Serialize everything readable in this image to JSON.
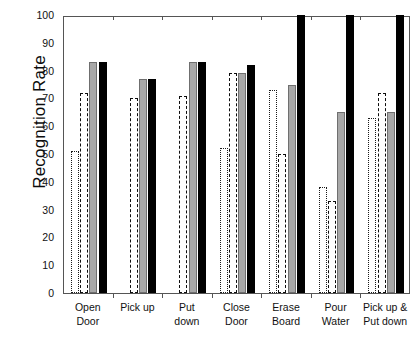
{
  "chart_data": {
    "type": "bar",
    "title": "",
    "subtitle": "",
    "xlabel": "",
    "ylabel": "Recognition Rate",
    "categories": [
      "Open\nDoor",
      "Pick up",
      "Put\ndown",
      "Close\nDoor",
      "Erase\nBoard",
      "Pour\nWater",
      "Pick up &\nPut down"
    ],
    "ylim": [
      0,
      100
    ],
    "xlim_note": "7 categories, 4 bars per group",
    "yticks": [
      0,
      10,
      20,
      30,
      40,
      50,
      60,
      70,
      80,
      90,
      100
    ],
    "ytick_labels": [
      "0",
      "10",
      "20",
      "30",
      "40",
      "50",
      "60",
      "70",
      "80",
      "90",
      "100"
    ],
    "grid": false,
    "legend": "none",
    "legend_position": "none",
    "series": [
      {
        "name": "series-1",
        "style": "dotted-outline",
        "values": [
          51,
          0,
          0,
          52,
          73,
          38,
          63
        ]
      },
      {
        "name": "series-2",
        "style": "dashed-outline",
        "values": [
          72,
          70,
          71,
          79,
          50,
          33,
          72
        ]
      },
      {
        "name": "series-3",
        "style": "gray-fill",
        "values": [
          83,
          77,
          83,
          79,
          75,
          65,
          65
        ]
      },
      {
        "name": "series-4",
        "style": "black-fill",
        "values": [
          83,
          77,
          83,
          82,
          100,
          100,
          100
        ]
      }
    ],
    "colors": {
      "gray_fill": "#a8a8a8",
      "black_fill": "#000000",
      "outline": "#0d0d0d",
      "background": "#ffffff",
      "axis": "#555555"
    }
  }
}
